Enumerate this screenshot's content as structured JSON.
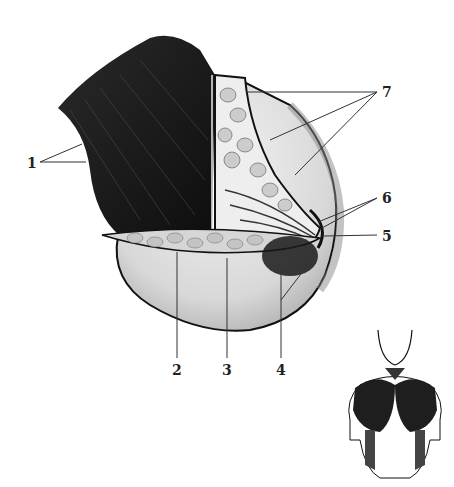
{
  "diagram": {
    "type": "anatomical-illustration",
    "labels": [
      {
        "id": "1",
        "text": "1",
        "x": 27,
        "y": 156
      },
      {
        "id": "2",
        "text": "2",
        "x": 22,
        "y": 372
      },
      {
        "id": "3",
        "text": "3",
        "x": 72,
        "y": 372
      },
      {
        "id": "4",
        "text": "4",
        "x": 125,
        "y": 372
      },
      {
        "id": "5",
        "text": "5",
        "x": 382,
        "y": 231
      },
      {
        "id": "6",
        "text": "6",
        "x": 382,
        "y": 192
      },
      {
        "id": "7",
        "text": "7",
        "x": 382,
        "y": 86
      }
    ],
    "colors": {
      "muscle": "#1a1a1a",
      "fat_lobules": "#cfcfcf",
      "skin": "#e2e2e2",
      "outline": "#111111",
      "leader_lines": "#333333",
      "background": "#ffffff"
    }
  }
}
